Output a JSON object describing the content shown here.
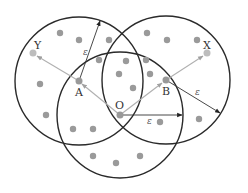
{
  "diagram": {
    "labels": {
      "point_y": "Y",
      "point_x": "X",
      "point_a": "A",
      "point_b": "B",
      "point_o": "O"
    },
    "radius_labels": {
      "eps_a": "ε",
      "eps_b": "ε",
      "eps_o": "ε"
    },
    "neighborhoods": [
      {
        "center": "A",
        "label": "ε-neighborhood of A"
      },
      {
        "center": "B",
        "label": "ε-neighborhood of B"
      },
      {
        "center": "O",
        "label": "ε-neighborhood of O"
      }
    ],
    "chains": [
      {
        "from": "O",
        "to": "A"
      },
      {
        "from": "A",
        "to": "Y"
      },
      {
        "from": "O",
        "to": "B"
      },
      {
        "from": "B",
        "to": "X"
      }
    ],
    "colors": {
      "circle": "#2a2a2a",
      "point": "#9a9a9a",
      "endpoint": "#bdbdbd",
      "chain_arrow": "#b0b0b0",
      "radius_arrow": "#333333"
    }
  }
}
